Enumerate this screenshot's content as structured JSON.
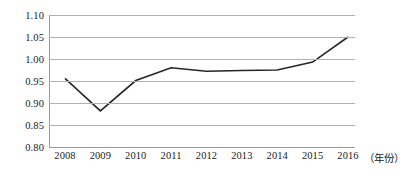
{
  "chart_data": {
    "type": "line",
    "title": "",
    "subtitle": "",
    "xlabel": "（年份）",
    "ylabel": "",
    "categories": [
      "2008",
      "2009",
      "2010",
      "2011",
      "2012",
      "2013",
      "2014",
      "2015",
      "2016"
    ],
    "x": [
      2008,
      2009,
      2010,
      2011,
      2012,
      2013,
      2014,
      2015,
      2016
    ],
    "values": [
      0.956,
      0.882,
      0.951,
      0.98,
      0.972,
      0.974,
      0.975,
      0.993,
      1.05
    ],
    "series": [
      {
        "name": "",
        "values": [
          0.956,
          0.882,
          0.951,
          0.98,
          0.972,
          0.974,
          0.975,
          0.993,
          1.05
        ]
      }
    ],
    "ylim": [
      0.8,
      1.1
    ],
    "ytick_step": 0.05,
    "yticks": [
      0.8,
      0.85,
      0.9,
      0.95,
      1.0,
      1.05,
      1.1
    ],
    "ytick_labels": [
      "0.80",
      "0.85",
      "0.90",
      "0.95",
      "1.00",
      "1.05",
      "1.10"
    ],
    "grid": "horizontal",
    "legend": "none",
    "markers": false,
    "line_color": "#262626",
    "grid_color": "#b0b0b0",
    "axis_color": "#9a9a9a",
    "background": "#ffffff",
    "annotations": []
  }
}
